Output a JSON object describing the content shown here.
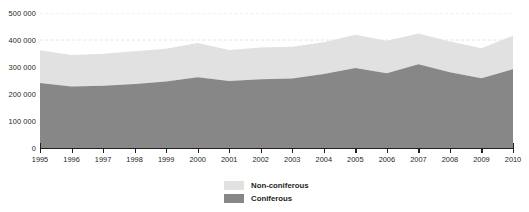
{
  "chart_data": {
    "type": "area",
    "stacked": true,
    "title": "",
    "xlabel": "",
    "ylabel": "",
    "x": [
      1995,
      1996,
      1997,
      1998,
      1999,
      2000,
      2001,
      2002,
      2003,
      2004,
      2005,
      2006,
      2007,
      2008,
      2009,
      2010
    ],
    "categories": [
      "1995",
      "1996",
      "1997",
      "1998",
      "1999",
      "2000",
      "2001",
      "2002",
      "2003",
      "2004",
      "2005",
      "2006",
      "2007",
      "2008",
      "2009",
      "2010"
    ],
    "series": [
      {
        "name": "Coniferous",
        "color": "#878787",
        "values": [
          241000,
          228000,
          231000,
          237000,
          246000,
          262000,
          248000,
          255000,
          257000,
          274000,
          296000,
          277000,
          310000,
          281000,
          258000,
          292000
        ]
      },
      {
        "name": "Non-coniferous",
        "color": "#e1e1e1",
        "values": [
          121000,
          116000,
          118000,
          121000,
          122000,
          127000,
          115000,
          117000,
          118000,
          118000,
          123000,
          120000,
          114000,
          113000,
          111000,
          124000
        ]
      }
    ],
    "totals": [
      362000,
      344000,
      349000,
      358000,
      368000,
      389000,
      363000,
      372000,
      375000,
      392000,
      419000,
      397000,
      424000,
      394000,
      369000,
      416000
    ],
    "ylim": [
      0,
      500000
    ],
    "yticks": [
      0,
      100000,
      200000,
      300000,
      400000,
      500000
    ],
    "ytick_labels": [
      "0",
      "100 000",
      "200 000",
      "300 000",
      "400 000",
      "500 000"
    ],
    "grid": true,
    "grid_color": "#e8d9d3",
    "legend_position": "bottom-center"
  },
  "legend": {
    "items": [
      {
        "label": "Non-coniferous",
        "color": "#e1e1e1"
      },
      {
        "label": "Coniferous",
        "color": "#878787"
      }
    ]
  },
  "axis": {
    "line_color": "#231f20"
  }
}
